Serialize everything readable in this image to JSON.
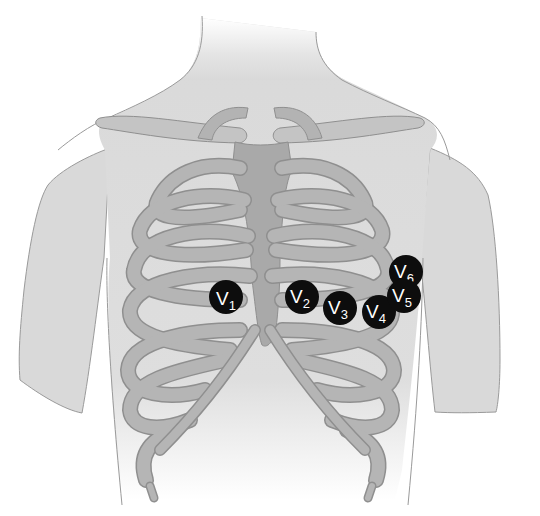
{
  "diagram": {
    "colors": {
      "background": "#ffffff",
      "skin": "#d9d9d9",
      "skin_outline": "#9a9a9a",
      "bone": "#b3b3b3",
      "bone_outline": "#8f8f8f",
      "sternum": "#a6a6a6",
      "electrode": "#0d0d0d",
      "electrode_text": "#ffffff"
    },
    "electrodes": [
      {
        "id": "V1",
        "letter": "V",
        "sub": "1",
        "cx": 226,
        "cy": 297,
        "r": 17
      },
      {
        "id": "V2",
        "letter": "V",
        "sub": "2",
        "cx": 302,
        "cy": 297,
        "r": 17
      },
      {
        "id": "V3",
        "letter": "V",
        "sub": "3",
        "cx": 340,
        "cy": 308,
        "r": 17
      },
      {
        "id": "V4",
        "letter": "V",
        "sub": "4",
        "cx": 379,
        "cy": 312,
        "r": 17
      },
      {
        "id": "V5",
        "letter": "V",
        "sub": "5",
        "cx": 404,
        "cy": 296,
        "r": 17
      },
      {
        "id": "V6",
        "letter": "V",
        "sub": "6",
        "cx": 406,
        "cy": 272,
        "r": 17
      }
    ]
  }
}
